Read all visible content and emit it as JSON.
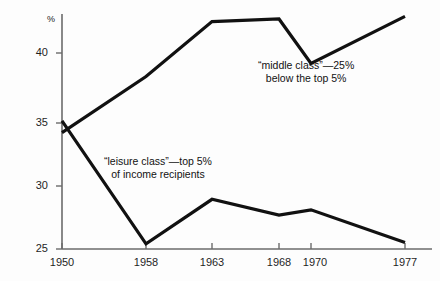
{
  "chart_data": {
    "type": "line",
    "title": "",
    "xlabel": "",
    "ylabel": "%",
    "x": [
      1950,
      1958,
      1963,
      1968,
      1970,
      1977
    ],
    "categories": [
      "1950",
      "1958",
      "1963",
      "1968",
      "1970",
      "1977"
    ],
    "xlim": [
      1950,
      1977
    ],
    "ylim": [
      25,
      43.5
    ],
    "ytick_values": [
      25,
      30,
      35,
      40
    ],
    "ytick_labels": [
      "25",
      "30",
      "35",
      "40"
    ],
    "xtick_labels": [
      "1950",
      "1958",
      "1963",
      "1968",
      "1970",
      "1977"
    ],
    "grid": false,
    "legend": "annotations-inline",
    "series": [
      {
        "name": "“middle class”—25% below the top 5%",
        "values": [
          33.9,
          38.2,
          42.4,
          42.6,
          39.2,
          42.8
        ],
        "color": "#111111"
      },
      {
        "name": "“leisure class”—top 5% of income recipients",
        "values": [
          34.8,
          25.4,
          28.8,
          27.6,
          28.0,
          25.5
        ],
        "color": "#111111"
      }
    ],
    "annotations": [
      {
        "id": "middle-class",
        "line1": "“middle class”—25%",
        "line2": "below the top 5%"
      },
      {
        "id": "leisure-class",
        "line1": "“leisure class”—top 5%",
        "line2": "of income recipients"
      }
    ]
  },
  "axis": {
    "unit": "%",
    "y_labels": [
      "40",
      "35",
      "30",
      "25"
    ],
    "x_labels": [
      "1950",
      "1958",
      "1963",
      "1968",
      "1970",
      "1977"
    ]
  },
  "colors": {
    "line": "#111111",
    "axis": "#6b6b6b",
    "text": "#1a1a1a",
    "background": "#fdfdfd"
  }
}
